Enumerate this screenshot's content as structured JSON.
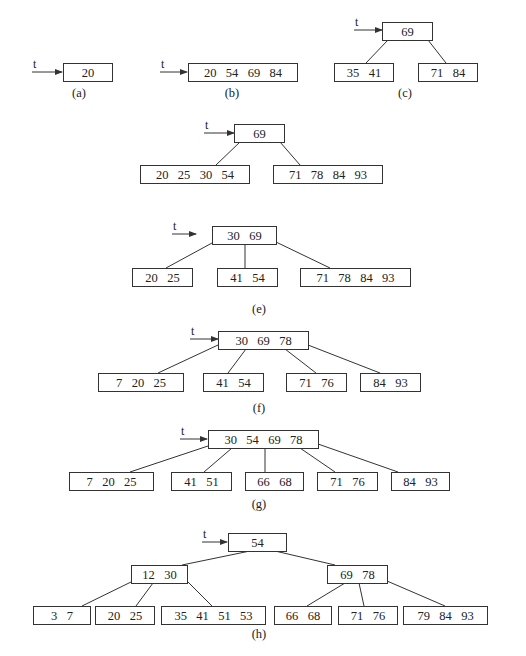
{
  "diagram": {
    "pointer_label": "t",
    "colors": {
      "stroke": "#333333",
      "text": "#222222",
      "background": "#ffffff"
    },
    "panels": [
      {
        "id": "a",
        "caption": "(a)",
        "caption_pos": [
          79,
          97
        ],
        "pointer": {
          "x1": 32,
          "x2": 62,
          "y": 72
        },
        "nodes": [
          {
            "x": 63,
            "y": 63,
            "w": 49,
            "h": 18,
            "keys": [
              "20"
            ]
          }
        ],
        "edges": []
      },
      {
        "id": "b",
        "caption": "(b)",
        "caption_pos": [
          232,
          97
        ],
        "pointer": {
          "x1": 160,
          "x2": 187,
          "y": 72
        },
        "nodes": [
          {
            "x": 188,
            "y": 63,
            "w": 109,
            "h": 18,
            "keys": [
              "20",
              "54",
              "69",
              "84"
            ]
          }
        ],
        "edges": []
      },
      {
        "id": "c",
        "caption": "(c)",
        "caption_pos": [
          405,
          97
        ],
        "pointer": {
          "x1": 354,
          "x2": 382,
          "y": 30
        },
        "nodes": [
          {
            "x": 382,
            "y": 22,
            "w": 50,
            "h": 18,
            "keys": [
              "69"
            ]
          },
          {
            "x": 334,
            "y": 63,
            "w": 59,
            "h": 18,
            "keys": [
              "35",
              "41"
            ]
          },
          {
            "x": 418,
            "y": 63,
            "w": 59,
            "h": 18,
            "keys": [
              "71",
              "84"
            ]
          }
        ],
        "edges": [
          [
            388,
            40,
            366,
            63
          ],
          [
            428,
            40,
            446,
            63
          ]
        ]
      },
      {
        "id": "d",
        "caption": "(d)",
        "caption_pos": [
          263,
          238
        ],
        "pointer": {
          "x1": 204,
          "x2": 234,
          "y": 133
        },
        "nodes": [
          {
            "x": 234,
            "y": 124,
            "w": 50,
            "h": 18,
            "keys": [
              "69"
            ]
          },
          {
            "x": 140,
            "y": 165,
            "w": 109,
            "h": 18,
            "keys": [
              "20",
              "25",
              "30",
              "54"
            ]
          },
          {
            "x": 273,
            "y": 165,
            "w": 109,
            "h": 18,
            "keys": [
              "71",
              "78",
              "84",
              "93"
            ]
          }
        ],
        "edges": [
          [
            240,
            142,
            216,
            165
          ],
          [
            280,
            142,
            300,
            165
          ]
        ]
      },
      {
        "id": "e",
        "caption": "(e)",
        "caption_pos": [
          259,
          313
        ],
        "pointer": {
          "x1": 172,
          "x2": 196,
          "y": 234
        },
        "nodes": [
          {
            "x": 212,
            "y": 226,
            "w": 64,
            "h": 18,
            "keys": [
              "30",
              "69"
            ]
          },
          {
            "x": 132,
            "y": 268,
            "w": 60,
            "h": 18,
            "keys": [
              "20",
              "25"
            ]
          },
          {
            "x": 217,
            "y": 268,
            "w": 60,
            "h": 18,
            "keys": [
              "41",
              "54"
            ]
          },
          {
            "x": 300,
            "y": 268,
            "w": 110,
            "h": 18,
            "keys": [
              "71",
              "78",
              "84",
              "93"
            ]
          }
        ],
        "edges": [
          [
            212,
            243,
            166,
            268
          ],
          [
            245,
            244,
            245,
            268
          ],
          [
            276,
            242,
            330,
            268
          ]
        ]
      },
      {
        "id": "f",
        "caption": "(f)",
        "caption_pos": [
          259,
          412
        ],
        "pointer": {
          "x1": 190,
          "x2": 218,
          "y": 339
        },
        "nodes": [
          {
            "x": 218,
            "y": 331,
            "w": 90,
            "h": 18,
            "keys": [
              "30",
              "69",
              "78"
            ]
          },
          {
            "x": 98,
            "y": 373,
            "w": 85,
            "h": 18,
            "keys": [
              "7",
              "20",
              "25"
            ]
          },
          {
            "x": 203,
            "y": 373,
            "w": 60,
            "h": 18,
            "keys": [
              "41",
              "54"
            ]
          },
          {
            "x": 286,
            "y": 373,
            "w": 60,
            "h": 18,
            "keys": [
              "71",
              "76"
            ]
          },
          {
            "x": 360,
            "y": 373,
            "w": 60,
            "h": 18,
            "keys": [
              "84",
              "93"
            ]
          }
        ],
        "edges": [
          [
            218,
            345,
            158,
            373
          ],
          [
            246,
            349,
            228,
            373
          ],
          [
            285,
            349,
            316,
            373
          ],
          [
            308,
            345,
            380,
            373
          ]
        ]
      },
      {
        "id": "g",
        "caption": "(g)",
        "caption_pos": [
          259,
          508
        ],
        "pointer": {
          "x1": 180,
          "x2": 207,
          "y": 439
        },
        "nodes": [
          {
            "x": 208,
            "y": 430,
            "w": 110,
            "h": 18,
            "keys": [
              "30",
              "54",
              "69",
              "78"
            ]
          },
          {
            "x": 69,
            "y": 472,
            "w": 84,
            "h": 18,
            "keys": [
              "7",
              "20",
              "25"
            ]
          },
          {
            "x": 171,
            "y": 472,
            "w": 60,
            "h": 18,
            "keys": [
              "41",
              "51"
            ]
          },
          {
            "x": 245,
            "y": 472,
            "w": 58,
            "h": 18,
            "keys": [
              "66",
              "68"
            ]
          },
          {
            "x": 317,
            "y": 472,
            "w": 60,
            "h": 18,
            "keys": [
              "71",
              "76"
            ]
          },
          {
            "x": 391,
            "y": 472,
            "w": 58,
            "h": 18,
            "keys": [
              "84",
              "93"
            ]
          }
        ],
        "edges": [
          [
            208,
            446,
            130,
            472
          ],
          [
            232,
            448,
            204,
            472
          ],
          [
            265,
            448,
            265,
            472
          ],
          [
            300,
            448,
            335,
            472
          ],
          [
            318,
            444,
            398,
            472
          ]
        ]
      },
      {
        "id": "h",
        "caption": "(h)",
        "caption_pos": [
          259,
          638
        ],
        "pointer": {
          "x1": 202,
          "x2": 227,
          "y": 542
        },
        "nodes": [
          {
            "x": 228,
            "y": 533,
            "w": 58,
            "h": 18,
            "keys": [
              "54"
            ]
          },
          {
            "x": 131,
            "y": 565,
            "w": 56,
            "h": 18,
            "keys": [
              "12",
              "30"
            ]
          },
          {
            "x": 327,
            "y": 565,
            "w": 60,
            "h": 18,
            "keys": [
              "69",
              "78"
            ]
          },
          {
            "x": 33,
            "y": 606,
            "w": 57,
            "h": 18,
            "keys": [
              "3",
              "7"
            ]
          },
          {
            "x": 95,
            "y": 606,
            "w": 59,
            "h": 18,
            "keys": [
              "20",
              "25"
            ]
          },
          {
            "x": 161,
            "y": 606,
            "w": 104,
            "h": 18,
            "keys": [
              "35",
              "41",
              "51",
              "53"
            ]
          },
          {
            "x": 274,
            "y": 606,
            "w": 57,
            "h": 18,
            "keys": [
              "66",
              "68"
            ]
          },
          {
            "x": 338,
            "y": 606,
            "w": 59,
            "h": 18,
            "keys": [
              "71",
              "76"
            ]
          },
          {
            "x": 403,
            "y": 606,
            "w": 84,
            "h": 18,
            "keys": [
              "79",
              "84",
              "93"
            ]
          }
        ],
        "edges": [
          [
            250,
            551,
            182,
            565
          ],
          [
            275,
            551,
            335,
            565
          ],
          [
            131,
            582,
            82,
            606
          ],
          [
            153,
            583,
            136,
            606
          ],
          [
            187,
            581,
            212,
            606
          ],
          [
            345,
            583,
            307,
            606
          ],
          [
            359,
            583,
            364,
            606
          ],
          [
            387,
            581,
            445,
            606
          ]
        ]
      }
    ]
  }
}
